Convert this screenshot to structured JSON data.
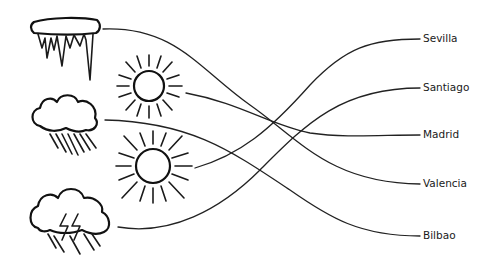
{
  "diagram": {
    "type": "matching-exercise",
    "weather_icons": [
      {
        "id": "icicles",
        "name": "icicles-icon",
        "y": 32
      },
      {
        "id": "sun-small",
        "name": "sun-icon",
        "y": 88
      },
      {
        "id": "rain-cloud",
        "name": "rain-cloud-icon",
        "y": 125
      },
      {
        "id": "sun-large",
        "name": "sun-icon",
        "y": 165
      },
      {
        "id": "storm-cloud",
        "name": "storm-cloud-icon",
        "y": 222
      }
    ],
    "cities": [
      {
        "label": "Sevilla",
        "y": 39
      },
      {
        "label": "Santiago",
        "y": 88
      },
      {
        "label": "Madrid",
        "y": 135
      },
      {
        "label": "Valencia",
        "y": 184
      },
      {
        "label": "Bilbao",
        "y": 236
      }
    ],
    "connections": [
      {
        "from": "icicles",
        "to": "Valencia"
      },
      {
        "from": "sun-small",
        "to": "Madrid"
      },
      {
        "from": "rain-cloud",
        "to": "Bilbao"
      },
      {
        "from": "sun-large",
        "to": "Sevilla"
      },
      {
        "from": "storm-cloud",
        "to": "Santiago"
      }
    ],
    "line_color": "#222222"
  }
}
